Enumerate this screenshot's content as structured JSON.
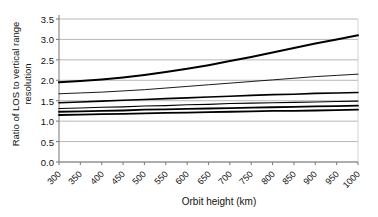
{
  "chart_data": {
    "type": "line",
    "title": "",
    "xlabel": "Orbit height (km)",
    "ylabel": "Ratio of LOS to vertical range resolution",
    "ylabel_line1": "Ratio of LOS to vertical range",
    "ylabel_line2": "resolution",
    "x": [
      300,
      350,
      400,
      450,
      500,
      550,
      600,
      650,
      700,
      750,
      800,
      850,
      900,
      950,
      1000
    ],
    "xtick_labels": [
      "300",
      "350",
      "400",
      "450",
      "500",
      "550",
      "600",
      "650",
      "700",
      "750",
      "800",
      "850",
      "900",
      "950",
      "1000"
    ],
    "ytick_labels": [
      "0.0",
      "0.5",
      "1.0",
      "1.5",
      "2.0",
      "2.5",
      "3.0",
      "3.5"
    ],
    "ytick_values": [
      0.0,
      0.5,
      1.0,
      1.5,
      2.0,
      2.5,
      3.0,
      3.5
    ],
    "xlim": [
      300,
      1000
    ],
    "ylim": [
      0.0,
      3.5
    ],
    "grid": "horizontal",
    "legend": "none",
    "line_color": "#000000",
    "grid_color": "#a6a6a6",
    "axis_color": "#808080",
    "background": "#ffffff",
    "series": [
      {
        "name": "series-1",
        "width": 2.0,
        "values": [
          1.95,
          1.98,
          2.02,
          2.07,
          2.13,
          2.2,
          2.28,
          2.37,
          2.47,
          2.57,
          2.68,
          2.79,
          2.9,
          3.0,
          3.1
        ]
      },
      {
        "name": "series-2",
        "width": 0.9,
        "values": [
          1.67,
          1.69,
          1.71,
          1.74,
          1.77,
          1.81,
          1.85,
          1.89,
          1.93,
          1.97,
          2.01,
          2.05,
          2.09,
          2.12,
          2.15
        ]
      },
      {
        "name": "series-3",
        "width": 1.6,
        "values": [
          1.45,
          1.47,
          1.49,
          1.51,
          1.53,
          1.55,
          1.57,
          1.59,
          1.61,
          1.63,
          1.65,
          1.66,
          1.68,
          1.69,
          1.7
        ]
      },
      {
        "name": "series-4",
        "width": 1.1,
        "values": [
          1.31,
          1.32,
          1.34,
          1.35,
          1.37,
          1.38,
          1.4,
          1.41,
          1.43,
          1.44,
          1.45,
          1.46,
          1.47,
          1.48,
          1.49
        ]
      },
      {
        "name": "series-5",
        "width": 1.8,
        "values": [
          1.23,
          1.24,
          1.25,
          1.26,
          1.28,
          1.29,
          1.3,
          1.31,
          1.32,
          1.33,
          1.34,
          1.35,
          1.36,
          1.37,
          1.38
        ]
      },
      {
        "name": "series-6",
        "width": 1.8,
        "values": [
          1.15,
          1.16,
          1.17,
          1.18,
          1.19,
          1.2,
          1.21,
          1.22,
          1.23,
          1.24,
          1.25,
          1.25,
          1.26,
          1.27,
          1.28
        ]
      }
    ]
  }
}
